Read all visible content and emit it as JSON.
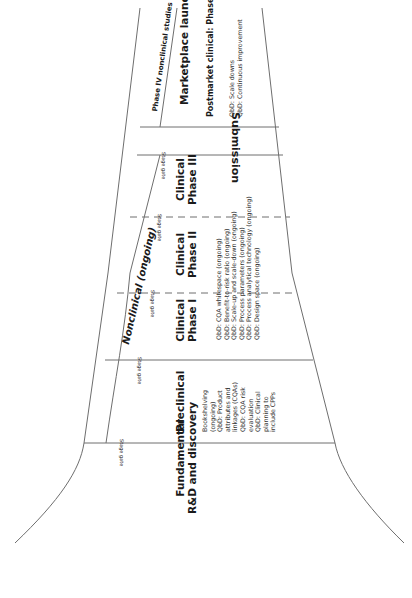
{
  "diagram": {
    "type": "funnel",
    "orientation": "rotated-90",
    "line_color": "#6e6e6e",
    "stages": [
      {
        "id": "fundamental",
        "title_lines": [
          "Fundamental",
          "R&D and discovery"
        ],
        "notes": []
      },
      {
        "id": "preclinical",
        "title_lines": [
          "Preclinical"
        ],
        "notes": [
          "Bookshelving",
          "(ongoing)",
          "",
          "QbD: Product",
          "attributes and",
          "linkages (CQAs)",
          "QbD: CQA risk",
          "evaluation",
          "QbD: Clinical",
          "planning to",
          "include CPPs"
        ]
      },
      {
        "id": "clinical-phase-1",
        "title_lines": [
          "Clinical",
          "Phase I"
        ]
      },
      {
        "id": "clinical-phase-2",
        "title_lines": [
          "Clinical",
          "Phase II"
        ]
      },
      {
        "id": "clinical-phase-3",
        "title_lines": [
          "Clinical",
          "Phase III"
        ]
      },
      {
        "id": "submission",
        "title_lines": [
          "Submission"
        ]
      },
      {
        "id": "marketplace",
        "title_lines": [
          "Marketplace launch"
        ],
        "subtitle": "Postmarket clinical: Phase IV",
        "notes": [
          "QbD: Scale downs",
          "QbD: Continuous improvement"
        ]
      }
    ],
    "clinical_notes": [
      "QbD: CQA whitespace (ongoing)",
      "QbD: Benefit-to-risk ratio (ongoing)",
      "QbD: Scale-up and scale-down (ongoing)",
      "QbD: Process parameters (ongoing)",
      "QbD: Process analytical technology (ongoing)",
      "QbD: Design space (ongoing)"
    ],
    "side_bands": {
      "nonclinical": "Nonclinical (ongoing)",
      "phase4_nonclinical": "Phase IV nonclinical studies"
    },
    "stage_gate_label": "Stage gate"
  }
}
